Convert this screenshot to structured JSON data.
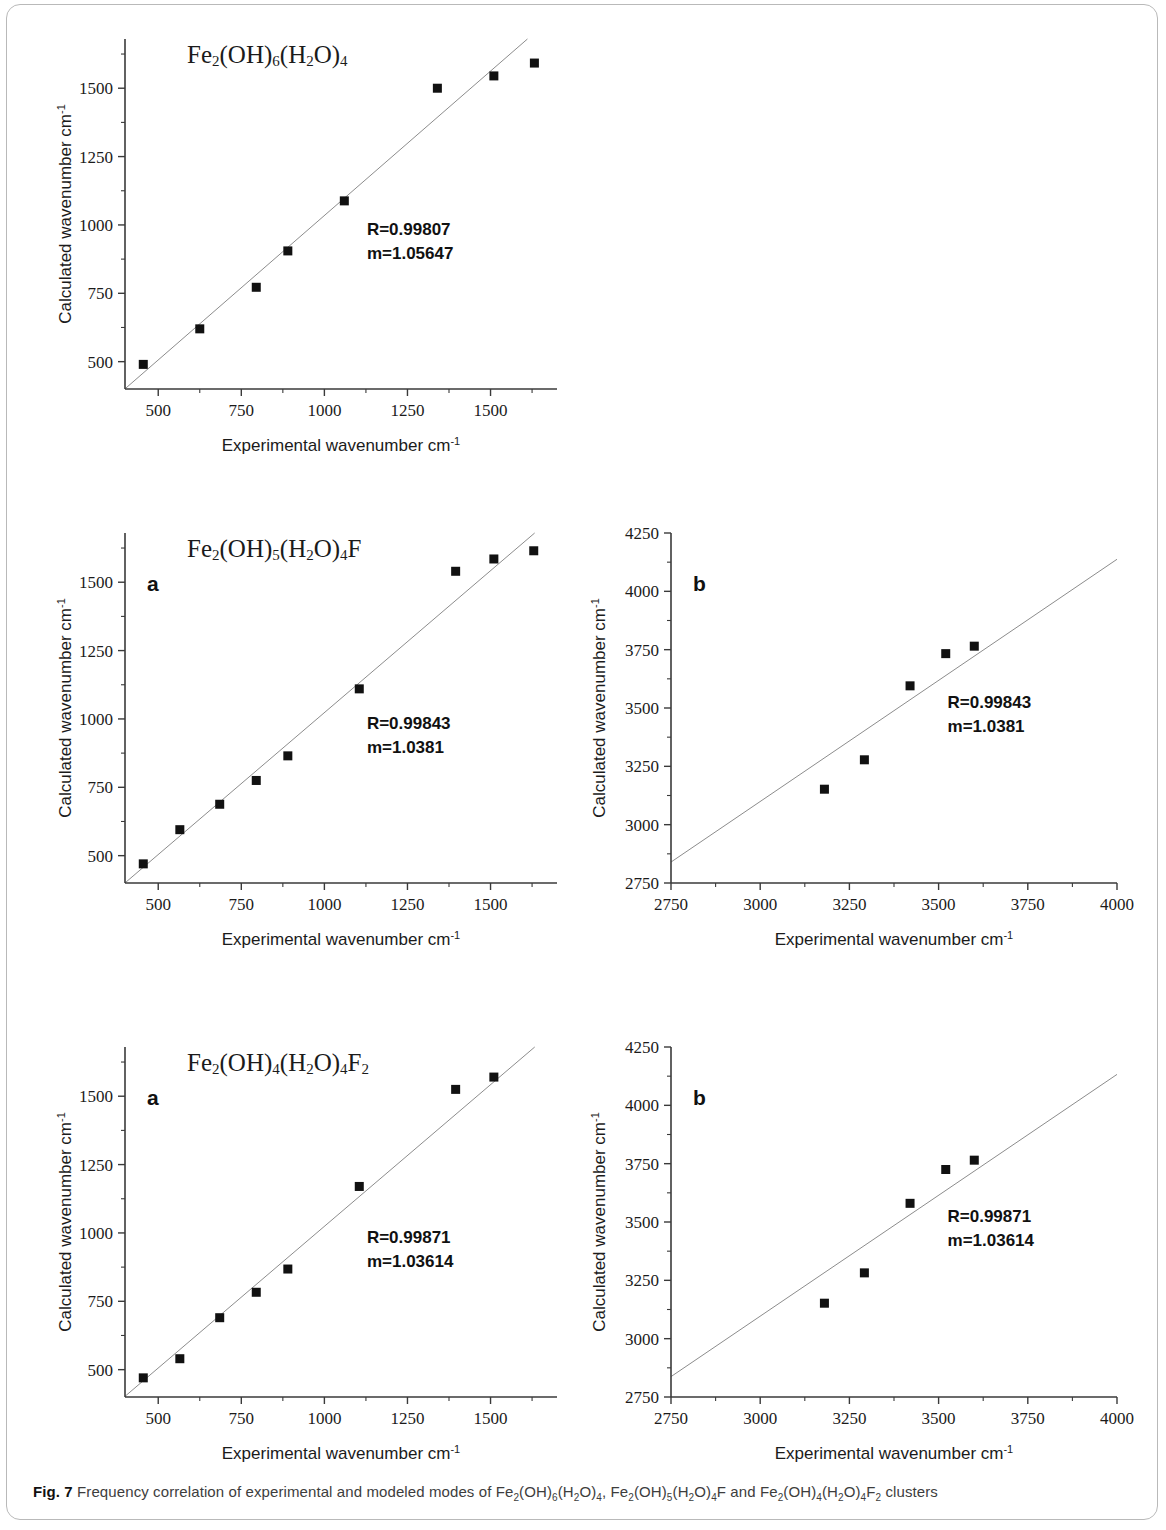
{
  "figure": {
    "label": "Fig. 7",
    "caption_parts": [
      "Frequency correlation of experimental and modeled modes of ",
      "Fe2(OH)6(H2O)4",
      ", ",
      "Fe2(OH)5(H2O)4F",
      " and ",
      "Fe2(OH)4(H2O)4F2",
      " clusters"
    ],
    "caption_text": "Frequency correlation of experimental and modeled modes of Fe2(OH)6(H2O)4, Fe2(OH)5(H2O)4F and Fe2(OH)4(H2O)4F2 clusters"
  },
  "axis_titles": {
    "x": "Experimental wavenumber cm",
    "x_sup": "-1",
    "y": "Calculated wavenumber cm",
    "y_sup": "-1"
  },
  "chart_data": [
    {
      "id": "panel-1",
      "type": "scatter",
      "title": "Fe2(OH)6(H2O)4",
      "panel_letter": "",
      "xlabel": "Experimental wavenumber cm-1",
      "ylabel": "Calculated wavenumber cm-1",
      "xlim": [
        400,
        1700
      ],
      "ylim": [
        400,
        1680
      ],
      "xticks": [
        500,
        750,
        1000,
        1250,
        1500
      ],
      "yticks": [
        500,
        750,
        1000,
        1250,
        1500
      ],
      "minor_tick_step": 125,
      "grid": false,
      "annotations": {
        "R": "R=0.99807",
        "m": "m=1.05647"
      },
      "fit": {
        "slope": 1.05647,
        "intercept": -22,
        "R": 0.99807
      },
      "points": [
        {
          "x": 455,
          "y": 490
        },
        {
          "x": 625,
          "y": 620
        },
        {
          "x": 795,
          "y": 772
        },
        {
          "x": 890,
          "y": 905
        },
        {
          "x": 1060,
          "y": 1088
        },
        {
          "x": 1340,
          "y": 1500
        },
        {
          "x": 1510,
          "y": 1545
        },
        {
          "x": 1632,
          "y": 1592
        }
      ]
    },
    {
      "id": "panel-2a",
      "type": "scatter",
      "title": "Fe2(OH)5(H2O)4F",
      "panel_letter": "a",
      "xlabel": "Experimental wavenumber cm-1",
      "ylabel": "Calculated wavenumber cm-1",
      "xlim": [
        400,
        1700
      ],
      "ylim": [
        400,
        1680
      ],
      "xticks": [
        500,
        750,
        1000,
        1250,
        1500
      ],
      "yticks": [
        500,
        750,
        1000,
        1250,
        1500
      ],
      "minor_tick_step": 125,
      "grid": false,
      "annotations": {
        "R": "R=0.99843",
        "m": "m=1.0381"
      },
      "fit": {
        "slope": 1.0381,
        "intercept": -15,
        "R": 0.99843
      },
      "points": [
        {
          "x": 455,
          "y": 470
        },
        {
          "x": 565,
          "y": 595
        },
        {
          "x": 685,
          "y": 688
        },
        {
          "x": 795,
          "y": 775
        },
        {
          "x": 890,
          "y": 865
        },
        {
          "x": 1105,
          "y": 1110
        },
        {
          "x": 1395,
          "y": 1540
        },
        {
          "x": 1510,
          "y": 1585
        },
        {
          "x": 1630,
          "y": 1615
        }
      ]
    },
    {
      "id": "panel-2b",
      "type": "scatter",
      "title": "",
      "panel_letter": "b",
      "xlabel": "Experimental wavenumber cm-1",
      "ylabel": "Calculated wavenumber cm-1",
      "xlim": [
        2750,
        4000
      ],
      "ylim": [
        2750,
        4250
      ],
      "xticks": [
        2750,
        3000,
        3250,
        3500,
        3750,
        4000
      ],
      "yticks": [
        2750,
        3000,
        3250,
        3500,
        3750,
        4000,
        4250
      ],
      "minor_tick_step": 125,
      "grid": false,
      "annotations": {
        "R": "R=0.99843",
        "m": "m=1.0381"
      },
      "fit": {
        "slope": 1.0381,
        "intercept": -15,
        "R": 0.99843
      },
      "points": [
        {
          "x": 3180,
          "y": 3152
        },
        {
          "x": 3292,
          "y": 3278
        },
        {
          "x": 3420,
          "y": 3595
        },
        {
          "x": 3520,
          "y": 3733
        },
        {
          "x": 3600,
          "y": 3765
        }
      ]
    },
    {
      "id": "panel-3a",
      "type": "scatter",
      "title": "Fe2(OH)4(H2O)4F2",
      "panel_letter": "a",
      "xlabel": "Experimental wavenumber cm-1",
      "ylabel": "Calculated wavenumber cm-1",
      "xlim": [
        400,
        1700
      ],
      "ylim": [
        400,
        1680
      ],
      "xticks": [
        500,
        750,
        1000,
        1250,
        1500
      ],
      "yticks": [
        500,
        750,
        1000,
        1250,
        1500
      ],
      "minor_tick_step": 125,
      "grid": false,
      "annotations": {
        "R": "R=0.99871",
        "m": "m=1.03614"
      },
      "fit": {
        "slope": 1.03614,
        "intercept": -12,
        "R": 0.99871
      },
      "points": [
        {
          "x": 455,
          "y": 470
        },
        {
          "x": 565,
          "y": 540
        },
        {
          "x": 685,
          "y": 690
        },
        {
          "x": 795,
          "y": 783
        },
        {
          "x": 890,
          "y": 868
        },
        {
          "x": 1105,
          "y": 1170
        },
        {
          "x": 1395,
          "y": 1525
        },
        {
          "x": 1510,
          "y": 1570
        }
      ]
    },
    {
      "id": "panel-3b",
      "type": "scatter",
      "title": "",
      "panel_letter": "b",
      "xlabel": "Experimental wavenumber cm-1",
      "ylabel": "Calculated wavenumber cm-1",
      "xlim": [
        2750,
        4000
      ],
      "ylim": [
        2750,
        4250
      ],
      "xticks": [
        2750,
        3000,
        3250,
        3500,
        3750,
        4000
      ],
      "yticks": [
        2750,
        3000,
        3250,
        3500,
        3750,
        4000,
        4250
      ],
      "minor_tick_step": 125,
      "grid": false,
      "annotations": {
        "R": "R=0.99871",
        "m": "m=1.03614"
      },
      "fit": {
        "slope": 1.03614,
        "intercept": -12,
        "R": 0.99871
      },
      "points": [
        {
          "x": 3180,
          "y": 3152
        },
        {
          "x": 3292,
          "y": 3282
        },
        {
          "x": 3420,
          "y": 3580
        },
        {
          "x": 3520,
          "y": 3725
        },
        {
          "x": 3600,
          "y": 3765
        }
      ]
    }
  ],
  "colors": {
    "marker": "#111111",
    "line": "#8c8c8c",
    "axis": "#3a3a3a",
    "text": "#1b1b1b",
    "frame": "#b9b9b9"
  }
}
